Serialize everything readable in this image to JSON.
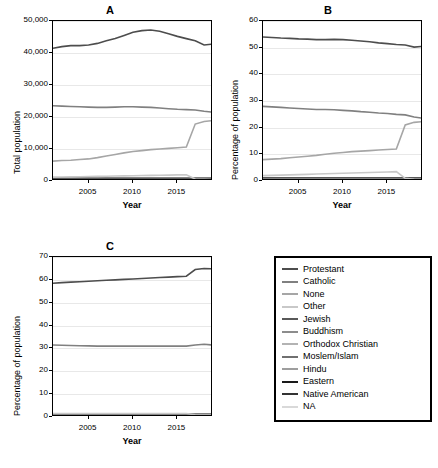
{
  "chart_data": [
    {
      "id": "A",
      "type": "line",
      "title": "A",
      "xlabel": "Year",
      "ylabel": "Total population",
      "xlim": [
        2001,
        2019
      ],
      "ylim": [
        0,
        50000
      ],
      "xticks": [
        2005,
        2010,
        2015
      ],
      "yticks": [
        0,
        10000,
        20000,
        30000,
        40000,
        50000
      ],
      "ytick_labels": [
        "0",
        "10,000",
        "20,000",
        "30,000",
        "40,000",
        "50,000"
      ],
      "x": [
        2001,
        2002,
        2003,
        2004,
        2005,
        2006,
        2007,
        2008,
        2009,
        2010,
        2011,
        2012,
        2013,
        2014,
        2015,
        2016,
        2017,
        2018,
        2019
      ],
      "series": [
        {
          "name": "Protestant",
          "color": "#4d4d4d",
          "values": [
            41500,
            42000,
            42300,
            42300,
            42500,
            43000,
            43800,
            44500,
            45500,
            46500,
            47000,
            47200,
            46800,
            46000,
            45200,
            44500,
            43800,
            42500,
            42800
          ]
        },
        {
          "name": "Catholic",
          "color": "#808080",
          "values": [
            23500,
            23400,
            23300,
            23200,
            23100,
            23000,
            23000,
            23100,
            23200,
            23200,
            23100,
            23000,
            22800,
            22600,
            22400,
            22300,
            22200,
            21800,
            21500
          ]
        },
        {
          "name": "None",
          "color": "#a6a6a6",
          "values": [
            6200,
            6400,
            6500,
            6700,
            6900,
            7300,
            7800,
            8300,
            8800,
            9200,
            9500,
            9800,
            10000,
            10200,
            10400,
            10600,
            17800,
            18600,
            18900
          ]
        },
        {
          "name": "Other",
          "color": "#c8c8c8",
          "values": [
            1200,
            1250,
            1300,
            1350,
            1400,
            1450,
            1500,
            1550,
            1600,
            1650,
            1700,
            1750,
            1800,
            1850,
            1900,
            1950,
            600,
            500,
            450
          ]
        },
        {
          "name": "Jewish",
          "color": "#595959",
          "values": [
            900,
            900,
            900,
            900,
            900,
            900,
            900,
            900,
            900,
            900,
            900,
            900,
            900,
            900,
            900,
            900,
            900,
            900,
            900
          ]
        },
        {
          "name": "Buddhism",
          "color": "#8c8c8c",
          "values": [
            500,
            500,
            500,
            500,
            500,
            500,
            500,
            500,
            500,
            500,
            500,
            500,
            500,
            500,
            500,
            500,
            500,
            500,
            500
          ]
        },
        {
          "name": "Orthodox Christian",
          "color": "#b3b3b3",
          "values": [
            400,
            400,
            400,
            400,
            400,
            400,
            400,
            400,
            400,
            400,
            400,
            400,
            400,
            400,
            400,
            400,
            400,
            400,
            400
          ]
        },
        {
          "name": "Moslem/Islam",
          "color": "#707070",
          "values": [
            300,
            300,
            300,
            300,
            300,
            300,
            300,
            300,
            300,
            300,
            300,
            300,
            300,
            300,
            300,
            300,
            300,
            300,
            300
          ]
        },
        {
          "name": "Hindu",
          "color": "#9e9e9e",
          "values": [
            250,
            250,
            250,
            250,
            250,
            250,
            250,
            250,
            250,
            250,
            250,
            250,
            250,
            250,
            250,
            250,
            250,
            250,
            250
          ]
        },
        {
          "name": "Eastern",
          "color": "#1a1a1a",
          "values": [
            200,
            200,
            200,
            200,
            200,
            200,
            200,
            200,
            200,
            200,
            200,
            200,
            200,
            200,
            200,
            200,
            200,
            200,
            200
          ]
        },
        {
          "name": "Native American",
          "color": "#333333",
          "values": [
            150,
            150,
            150,
            150,
            150,
            150,
            150,
            150,
            150,
            150,
            150,
            150,
            150,
            150,
            150,
            150,
            150,
            150,
            150
          ]
        },
        {
          "name": "NA",
          "color": "#d9d9d9",
          "values": [
            100,
            100,
            100,
            100,
            100,
            100,
            100,
            100,
            100,
            100,
            100,
            100,
            100,
            100,
            100,
            100,
            100,
            100,
            100
          ]
        }
      ]
    },
    {
      "id": "B",
      "type": "line",
      "title": "B",
      "xlabel": "Year",
      "ylabel": "Percentage of population",
      "xlim": [
        2001,
        2019
      ],
      "ylim": [
        0,
        60
      ],
      "xticks": [
        2005,
        2010,
        2015
      ],
      "yticks": [
        0,
        10,
        20,
        30,
        40,
        50,
        60
      ],
      "ytick_labels": [
        "0",
        "10",
        "20",
        "30",
        "40",
        "50",
        "60"
      ],
      "x": [
        2001,
        2002,
        2003,
        2004,
        2005,
        2006,
        2007,
        2008,
        2009,
        2010,
        2011,
        2012,
        2013,
        2014,
        2015,
        2016,
        2017,
        2018,
        2019
      ],
      "series": [
        {
          "name": "Protestant",
          "color": "#4d4d4d",
          "values": [
            54.0,
            53.8,
            53.6,
            53.5,
            53.3,
            53.2,
            53.0,
            53.0,
            53.1,
            53.0,
            52.8,
            52.5,
            52.2,
            51.8,
            51.5,
            51.2,
            51.0,
            50.2,
            50.5
          ]
        },
        {
          "name": "Catholic",
          "color": "#808080",
          "values": [
            28.0,
            27.8,
            27.6,
            27.4,
            27.2,
            27.0,
            26.8,
            26.8,
            26.7,
            26.5,
            26.3,
            26.0,
            25.8,
            25.5,
            25.3,
            25.0,
            24.8,
            24.0,
            23.5
          ]
        },
        {
          "name": "None",
          "color": "#a6a6a6",
          "values": [
            8.0,
            8.2,
            8.4,
            8.7,
            9.0,
            9.3,
            9.6,
            10.0,
            10.4,
            10.7,
            11.0,
            11.2,
            11.4,
            11.6,
            11.8,
            12.0,
            21.0,
            22.0,
            22.3
          ]
        },
        {
          "name": "Other",
          "color": "#c8c8c8",
          "values": [
            2.0,
            2.1,
            2.2,
            2.3,
            2.4,
            2.5,
            2.6,
            2.7,
            2.8,
            2.9,
            3.0,
            3.1,
            3.2,
            3.3,
            3.4,
            3.5,
            1.0,
            0.6,
            0.5
          ]
        },
        {
          "name": "Jewish",
          "color": "#595959",
          "values": [
            1.2,
            1.2,
            1.2,
            1.2,
            1.2,
            1.2,
            1.2,
            1.2,
            1.2,
            1.2,
            1.2,
            1.2,
            1.2,
            1.2,
            1.2,
            1.2,
            1.2,
            1.2,
            1.2
          ]
        },
        {
          "name": "Buddhism",
          "color": "#8c8c8c",
          "values": [
            0.7,
            0.7,
            0.7,
            0.7,
            0.7,
            0.7,
            0.7,
            0.7,
            0.7,
            0.7,
            0.7,
            0.7,
            0.7,
            0.7,
            0.7,
            0.7,
            0.7,
            0.7,
            0.7
          ]
        },
        {
          "name": "Orthodox Christian",
          "color": "#b3b3b3",
          "values": [
            0.5,
            0.5,
            0.5,
            0.5,
            0.5,
            0.5,
            0.5,
            0.5,
            0.5,
            0.5,
            0.5,
            0.5,
            0.5,
            0.5,
            0.5,
            0.5,
            0.5,
            0.5,
            0.5
          ]
        },
        {
          "name": "Moslem/Islam",
          "color": "#707070",
          "values": [
            0.4,
            0.4,
            0.4,
            0.4,
            0.4,
            0.4,
            0.4,
            0.4,
            0.4,
            0.4,
            0.4,
            0.4,
            0.4,
            0.4,
            0.4,
            0.4,
            0.4,
            0.4,
            0.4
          ]
        },
        {
          "name": "Hindu",
          "color": "#9e9e9e",
          "values": [
            0.3,
            0.3,
            0.3,
            0.3,
            0.3,
            0.3,
            0.3,
            0.3,
            0.3,
            0.3,
            0.3,
            0.3,
            0.3,
            0.3,
            0.3,
            0.3,
            0.3,
            0.3,
            0.3
          ]
        },
        {
          "name": "Eastern",
          "color": "#1a1a1a",
          "values": [
            0.25,
            0.25,
            0.25,
            0.25,
            0.25,
            0.25,
            0.25,
            0.25,
            0.25,
            0.25,
            0.25,
            0.25,
            0.25,
            0.25,
            0.25,
            0.25,
            0.25,
            0.25,
            0.25
          ]
        },
        {
          "name": "Native American",
          "color": "#333333",
          "values": [
            0.2,
            0.2,
            0.2,
            0.2,
            0.2,
            0.2,
            0.2,
            0.2,
            0.2,
            0.2,
            0.2,
            0.2,
            0.2,
            0.2,
            0.2,
            0.2,
            0.2,
            0.2,
            0.2
          ]
        },
        {
          "name": "NA",
          "color": "#d9d9d9",
          "values": [
            0.15,
            0.15,
            0.15,
            0.15,
            0.15,
            0.15,
            0.15,
            0.15,
            0.15,
            0.15,
            0.15,
            0.15,
            0.15,
            0.15,
            0.15,
            0.15,
            0.15,
            0.15,
            0.15
          ]
        }
      ]
    },
    {
      "id": "C",
      "type": "line",
      "title": "C",
      "xlabel": "Year",
      "ylabel": "Percentage of population",
      "xlim": [
        2001,
        2019
      ],
      "ylim": [
        0,
        70
      ],
      "xticks": [
        2005,
        2010,
        2015
      ],
      "yticks": [
        0,
        10,
        20,
        30,
        40,
        50,
        60,
        70
      ],
      "ytick_labels": [
        "0",
        "10",
        "20",
        "30",
        "40",
        "50",
        "60",
        "70"
      ],
      "x": [
        2001,
        2002,
        2003,
        2004,
        2005,
        2006,
        2007,
        2008,
        2009,
        2010,
        2011,
        2012,
        2013,
        2014,
        2015,
        2016,
        2017,
        2018,
        2019
      ],
      "series": [
        {
          "name": "Protestant",
          "color": "#4d4d4d",
          "values": [
            58.5,
            58.8,
            59.0,
            59.2,
            59.4,
            59.6,
            59.8,
            60.0,
            60.2,
            60.4,
            60.6,
            60.8,
            61.0,
            61.2,
            61.4,
            61.6,
            64.5,
            65.0,
            64.8
          ]
        },
        {
          "name": "Catholic",
          "color": "#808080",
          "values": [
            31.5,
            31.4,
            31.3,
            31.2,
            31.1,
            31.0,
            31.0,
            31.0,
            31.0,
            31.0,
            31.0,
            31.0,
            31.0,
            31.0,
            31.0,
            31.0,
            31.5,
            31.8,
            31.5
          ]
        },
        {
          "name": "None",
          "color": "#a6a6a6",
          "values": [
            0.6,
            0.6,
            0.6,
            0.6,
            0.6,
            0.6,
            0.6,
            0.6,
            0.6,
            0.6,
            0.6,
            0.6,
            0.6,
            0.6,
            0.6,
            0.6,
            0.6,
            0.6,
            0.6
          ]
        },
        {
          "name": "Other",
          "color": "#c8c8c8",
          "values": [
            1.5,
            1.5,
            1.5,
            1.5,
            1.5,
            1.5,
            1.5,
            1.5,
            1.5,
            1.5,
            1.5,
            1.5,
            1.5,
            1.5,
            1.5,
            1.5,
            1.0,
            0.8,
            0.8
          ]
        },
        {
          "name": "Jewish",
          "color": "#595959",
          "values": [
            1.3,
            1.3,
            1.3,
            1.3,
            1.3,
            1.3,
            1.3,
            1.3,
            1.3,
            1.3,
            1.3,
            1.3,
            1.3,
            1.3,
            1.3,
            1.3,
            1.3,
            1.3,
            1.3
          ]
        },
        {
          "name": "Buddhism",
          "color": "#8c8c8c",
          "values": [
            0.9,
            0.9,
            0.9,
            0.9,
            0.9,
            0.9,
            0.9,
            0.9,
            0.9,
            0.9,
            0.9,
            0.9,
            0.9,
            0.9,
            0.9,
            0.9,
            0.9,
            0.9,
            0.9
          ]
        },
        {
          "name": "Orthodox Christian",
          "color": "#b3b3b3",
          "values": [
            0.7,
            0.7,
            0.7,
            0.7,
            0.7,
            0.7,
            0.7,
            0.7,
            0.7,
            0.7,
            0.7,
            0.7,
            0.7,
            0.7,
            0.7,
            0.7,
            0.7,
            0.7,
            0.7
          ]
        },
        {
          "name": "Moslem/Islam",
          "color": "#707070",
          "values": [
            0.5,
            0.5,
            0.5,
            0.5,
            0.5,
            0.5,
            0.5,
            0.5,
            0.5,
            0.5,
            0.5,
            0.5,
            0.5,
            0.5,
            0.5,
            0.5,
            0.5,
            0.5,
            0.5
          ]
        },
        {
          "name": "Hindu",
          "color": "#9e9e9e",
          "values": [
            0.4,
            0.4,
            0.4,
            0.4,
            0.4,
            0.4,
            0.4,
            0.4,
            0.4,
            0.4,
            0.4,
            0.4,
            0.4,
            0.4,
            0.4,
            0.4,
            0.4,
            0.4,
            0.4
          ]
        },
        {
          "name": "Eastern",
          "color": "#1a1a1a",
          "values": [
            0.3,
            0.3,
            0.3,
            0.3,
            0.3,
            0.3,
            0.3,
            0.3,
            0.3,
            0.3,
            0.3,
            0.3,
            0.3,
            0.3,
            0.3,
            0.3,
            0.3,
            0.3,
            0.3
          ]
        },
        {
          "name": "Native American",
          "color": "#333333",
          "values": [
            0.25,
            0.25,
            0.25,
            0.25,
            0.25,
            0.25,
            0.25,
            0.25,
            0.25,
            0.25,
            0.25,
            0.25,
            0.25,
            0.25,
            0.25,
            0.25,
            0.25,
            0.25,
            0.25
          ]
        },
        {
          "name": "NA",
          "color": "#d9d9d9",
          "values": [
            0.2,
            0.2,
            0.2,
            0.2,
            0.2,
            0.2,
            0.2,
            0.2,
            0.2,
            0.2,
            0.2,
            0.2,
            0.2,
            0.2,
            0.2,
            0.2,
            0.2,
            0.2,
            0.2
          ]
        }
      ]
    }
  ],
  "legend": {
    "position": "bottom-right",
    "items": [
      {
        "label": "Protestant",
        "color": "#4d4d4d"
      },
      {
        "label": "Catholic",
        "color": "#808080"
      },
      {
        "label": "None",
        "color": "#a6a6a6"
      },
      {
        "label": "Other",
        "color": "#c8c8c8"
      },
      {
        "label": "Jewish",
        "color": "#595959"
      },
      {
        "label": "Buddhism",
        "color": "#8c8c8c"
      },
      {
        "label": "Orthodox Christian",
        "color": "#b3b3b3"
      },
      {
        "label": "Moslem/Islam",
        "color": "#707070"
      },
      {
        "label": "Hindu",
        "color": "#9e9e9e"
      },
      {
        "label": "Eastern",
        "color": "#1a1a1a"
      },
      {
        "label": "Native American",
        "color": "#333333"
      },
      {
        "label": "NA",
        "color": "#d9d9d9"
      }
    ]
  }
}
